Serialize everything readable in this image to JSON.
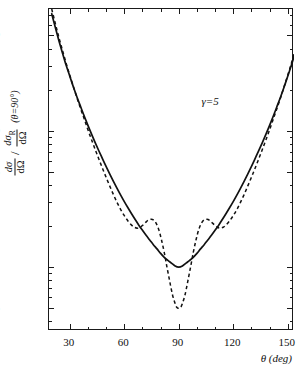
{
  "chart_data": {
    "type": "line",
    "title": "",
    "subtitle": "",
    "xlabel": "θ (deg)",
    "ylabel_parts": {
      "num1": "dσ",
      "den1": "dΩ",
      "slash": "/",
      "num2": "dσ",
      "num2_sub": "R",
      "den2": "dΩ",
      "condition": "(θ=90°)"
    },
    "ylabel_plain": "dσ/dΩ / dσR/dΩ  (θ=90°)",
    "annotations": [
      {
        "text": "γ=5",
        "x_deg": 103,
        "y_value": 18
      }
    ],
    "xscale": "linear",
    "yscale": "log",
    "xlim": [
      18.5,
      153.5
    ],
    "ylim": [
      0.34,
      78
    ],
    "xticks": [
      30,
      60,
      90,
      120,
      150
    ],
    "xtick_labels": [
      "30",
      "60",
      "90",
      "120",
      "150"
    ],
    "xticks_minor": [
      40,
      50,
      70,
      80,
      100,
      110,
      130,
      140
    ],
    "yticks": [
      50,
      10,
      5,
      1,
      0.5
    ],
    "ytick_labels": [
      "50",
      "10",
      "5",
      "1",
      "0.5"
    ],
    "yticks_minor": [
      0.4,
      0.6,
      0.7,
      0.8,
      0.9,
      2,
      3,
      4,
      6,
      7,
      8,
      9,
      20,
      30,
      40,
      60,
      70
    ],
    "grid": false,
    "legend": "none",
    "series": [
      {
        "name": "solid",
        "style": "solid",
        "color": "#111111",
        "width": 1.7,
        "points": [
          [
            20.0,
            72.0
          ],
          [
            22.0,
            57.0
          ],
          [
            24.0,
            45.5
          ],
          [
            26.0,
            36.8
          ],
          [
            28.0,
            30.0
          ],
          [
            30.0,
            25.0
          ],
          [
            32.0,
            20.8
          ],
          [
            34.0,
            17.5
          ],
          [
            36.0,
            14.9
          ],
          [
            38.0,
            12.7
          ],
          [
            40.0,
            10.9
          ],
          [
            42.0,
            9.4
          ],
          [
            44.0,
            8.15
          ],
          [
            46.0,
            7.1
          ],
          [
            48.0,
            6.22
          ],
          [
            50.0,
            5.45
          ],
          [
            52.0,
            4.8
          ],
          [
            54.0,
            4.25
          ],
          [
            56.0,
            3.78
          ],
          [
            58.0,
            3.37
          ],
          [
            60.0,
            3.02
          ],
          [
            62.0,
            2.72
          ],
          [
            64.0,
            2.46
          ],
          [
            66.0,
            2.23
          ],
          [
            68.0,
            2.03
          ],
          [
            70.0,
            1.86
          ],
          [
            72.0,
            1.71
          ],
          [
            74.0,
            1.58
          ],
          [
            76.0,
            1.46
          ],
          [
            78.0,
            1.36
          ],
          [
            80.0,
            1.26
          ],
          [
            82.0,
            1.18
          ],
          [
            84.0,
            1.12
          ],
          [
            86.0,
            1.07
          ],
          [
            88.0,
            1.02
          ],
          [
            90.0,
            1.0
          ],
          [
            92.0,
            1.02
          ],
          [
            94.0,
            1.07
          ],
          [
            96.0,
            1.12
          ],
          [
            98.0,
            1.18
          ],
          [
            100.0,
            1.26
          ],
          [
            102.0,
            1.36
          ],
          [
            104.0,
            1.46
          ],
          [
            106.0,
            1.58
          ],
          [
            108.0,
            1.71
          ],
          [
            110.0,
            1.86
          ],
          [
            112.0,
            2.03
          ],
          [
            114.0,
            2.23
          ],
          [
            116.0,
            2.46
          ],
          [
            118.0,
            2.72
          ],
          [
            120.0,
            3.02
          ],
          [
            122.0,
            3.37
          ],
          [
            124.0,
            3.78
          ],
          [
            126.0,
            4.25
          ],
          [
            128.0,
            4.8
          ],
          [
            130.0,
            5.45
          ],
          [
            132.0,
            6.22
          ],
          [
            134.0,
            7.1
          ],
          [
            136.0,
            8.15
          ],
          [
            138.0,
            9.4
          ],
          [
            140.0,
            10.9
          ],
          [
            142.0,
            12.7
          ],
          [
            144.0,
            14.9
          ],
          [
            146.0,
            17.5
          ],
          [
            148.0,
            20.8
          ],
          [
            150.0,
            25.0
          ],
          [
            152.0,
            30.0
          ],
          [
            153.5,
            35.0
          ]
        ]
      },
      {
        "name": "dashed",
        "style": "dashed",
        "color": "#111111",
        "width": 1.5,
        "dasharray": "3.4 2.8",
        "points": [
          [
            20.0,
            78.0
          ],
          [
            22.0,
            61.0
          ],
          [
            24.0,
            48.0
          ],
          [
            26.0,
            38.5
          ],
          [
            28.0,
            31.0
          ],
          [
            30.0,
            25.4
          ],
          [
            32.0,
            20.9
          ],
          [
            34.0,
            17.3
          ],
          [
            36.0,
            14.4
          ],
          [
            38.0,
            12.1
          ],
          [
            40.0,
            10.1
          ],
          [
            42.0,
            8.55
          ],
          [
            44.0,
            7.25
          ],
          [
            46.0,
            6.18
          ],
          [
            48.0,
            5.28
          ],
          [
            50.0,
            4.54
          ],
          [
            52.0,
            3.92
          ],
          [
            54.0,
            3.4
          ],
          [
            56.0,
            2.98
          ],
          [
            58.0,
            2.64
          ],
          [
            60.0,
            2.38
          ],
          [
            62.0,
            2.18
          ],
          [
            64.0,
            2.03
          ],
          [
            65.5,
            1.96
          ],
          [
            67.0,
            1.93
          ],
          [
            68.5,
            1.95
          ],
          [
            70.0,
            2.02
          ],
          [
            71.5,
            2.11
          ],
          [
            73.0,
            2.2
          ],
          [
            74.5,
            2.24
          ],
          [
            76.0,
            2.22
          ],
          [
            77.5,
            2.1
          ],
          [
            79.0,
            1.88
          ],
          [
            80.5,
            1.58
          ],
          [
            82.0,
            1.28
          ],
          [
            83.5,
            1.0
          ],
          [
            85.0,
            0.79
          ],
          [
            86.5,
            0.63
          ],
          [
            88.0,
            0.54
          ],
          [
            89.0,
            0.505
          ],
          [
            90.0,
            0.5
          ],
          [
            91.0,
            0.505
          ],
          [
            92.0,
            0.54
          ],
          [
            93.5,
            0.63
          ],
          [
            95.0,
            0.79
          ],
          [
            96.5,
            1.0
          ],
          [
            98.0,
            1.28
          ],
          [
            99.5,
            1.58
          ],
          [
            101.0,
            1.88
          ],
          [
            102.5,
            2.1
          ],
          [
            104.0,
            2.22
          ],
          [
            105.5,
            2.24
          ],
          [
            107.0,
            2.2
          ],
          [
            108.5,
            2.11
          ],
          [
            110.0,
            2.02
          ],
          [
            111.5,
            1.95
          ],
          [
            113.0,
            1.93
          ],
          [
            114.5,
            1.96
          ],
          [
            116.0,
            2.03
          ],
          [
            118.0,
            2.18
          ],
          [
            120.0,
            2.38
          ],
          [
            122.0,
            2.64
          ],
          [
            124.0,
            2.98
          ],
          [
            126.0,
            3.4
          ],
          [
            128.0,
            3.92
          ],
          [
            130.0,
            4.54
          ],
          [
            132.0,
            5.28
          ],
          [
            134.0,
            6.18
          ],
          [
            136.0,
            7.25
          ],
          [
            138.0,
            8.55
          ],
          [
            140.0,
            10.1
          ],
          [
            142.0,
            12.1
          ],
          [
            144.0,
            14.4
          ],
          [
            146.0,
            17.3
          ],
          [
            148.0,
            20.9
          ],
          [
            150.0,
            25.4
          ],
          [
            152.0,
            31.0
          ],
          [
            153.5,
            36.5
          ]
        ]
      }
    ]
  }
}
